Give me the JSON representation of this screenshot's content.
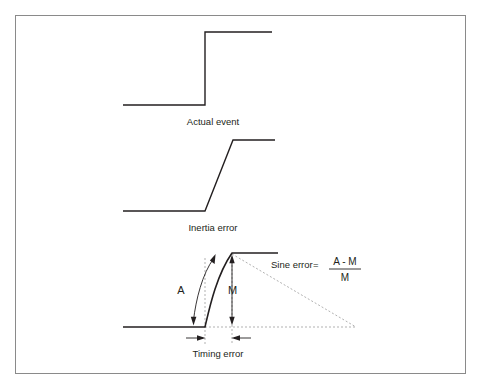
{
  "figure": {
    "background_color": "#ffffff",
    "border_color": "#8a8a8a",
    "stroke_color": "#231f20",
    "dashed_color": "#a8a8a8",
    "panels": [
      {
        "id": "actual-event",
        "label": "Actual event",
        "description": "ideal instantaneous step"
      },
      {
        "id": "inertia-error",
        "label": "Inertia error",
        "description": "linear ramped step"
      },
      {
        "id": "sine-error",
        "label": "Timing error",
        "description": "curved step with amplitude and measurement markers"
      }
    ],
    "annotations": {
      "amplitude_label": "A",
      "measured_label": "M",
      "timing_label": "Timing error"
    },
    "formula": {
      "name": "Sine error",
      "equals": "=",
      "numerator": "A - M",
      "denominator": "M"
    }
  }
}
